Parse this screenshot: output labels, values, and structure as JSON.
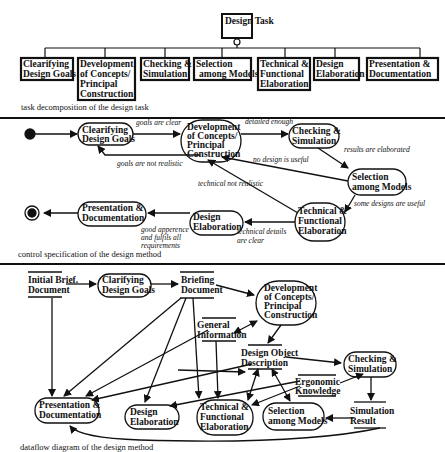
{
  "task_decomposition": {
    "root": "Design Task",
    "children": [
      [
        "Clearifying",
        "Design Goals"
      ],
      [
        "Development",
        "of Concepts/",
        "Principal",
        "Construction"
      ],
      [
        "Checking &",
        "Simulation"
      ],
      [
        "Selection",
        "among Models"
      ],
      [
        "Technical &",
        "Functional",
        "Elaboration"
      ],
      [
        "Design",
        "Elaboration"
      ],
      [
        "Presentation &",
        "Documentation"
      ]
    ],
    "caption": "task decomposition of the design task"
  },
  "control_spec": {
    "states": {
      "clarify": [
        "Clearifying",
        "Design Goals"
      ],
      "develop": [
        "Development",
        "of Concepts/",
        "Principal",
        "Construction"
      ],
      "check": [
        "Checking &",
        "Simulation"
      ],
      "select": [
        "Selection",
        "among Models"
      ],
      "technical": [
        "Technical &",
        "Functional",
        "Elaboration"
      ],
      "design": [
        "Design",
        "Elaboration"
      ],
      "present": [
        "Presentation &",
        "Documentation"
      ]
    },
    "transitions": {
      "goals_clear": "goals are clear",
      "goals_not_realistic": "goals are not realistic",
      "detailed_enough": "detailed enough",
      "results_elaborated": "results are elaborated",
      "no_design_useful": "no design is useful",
      "some_designs_useful": "some designs are useful",
      "technical_not_realistic": "technical not realistic",
      "technical_details_clear": [
        "technical details",
        "are clear"
      ],
      "good_appearence": [
        "good apperence",
        "and fulfils all",
        "requirements"
      ]
    },
    "caption": "control specification of the design method"
  },
  "dataflow": {
    "stores": {
      "initial_brief": [
        "Initial Brief.",
        "Document"
      ],
      "briefing": [
        "Briefing",
        "Document"
      ],
      "general_info": [
        "General",
        "Information"
      ],
      "design_object": [
        "Design Object",
        "Description"
      ],
      "ergonomic": [
        "Ergonomic",
        "Knowledge"
      ],
      "sim_result": [
        "Simulation",
        "Result"
      ]
    },
    "processes": {
      "clarify": [
        "Clarifying",
        "Design Goals"
      ],
      "develop": [
        "Development",
        "of Concepts/",
        "Principal",
        "Construction"
      ],
      "check": [
        "Checking &",
        "Simulation"
      ],
      "present": [
        "Presentation &",
        "Documentation"
      ],
      "design": [
        "Design",
        "Elaboration"
      ],
      "technical": [
        "Technical &",
        "Functional",
        "Elaboration"
      ],
      "select": [
        "Selection",
        "among Models"
      ]
    },
    "caption": "dataflow diagram of the design method"
  }
}
